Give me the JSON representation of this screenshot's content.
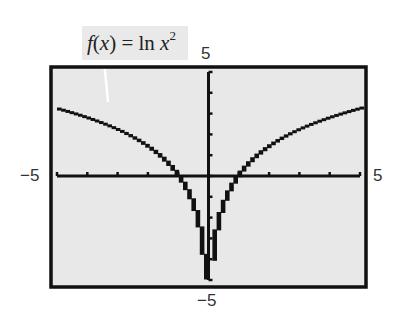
{
  "chart_data": {
    "type": "line",
    "function": "ln(x^2)",
    "xlabel": "",
    "ylabel": "",
    "xlim": [
      -5,
      5
    ],
    "ylim": [
      -5,
      5
    ],
    "xscale": 1,
    "yscale": 1,
    "grid": false,
    "window_labels": {
      "xmin": "−5",
      "xmax": "5",
      "ymin": "−5",
      "ymax": "5"
    },
    "series": [
      {
        "name": "f(x) = ln x^2",
        "x": [
          -5,
          -4,
          -3,
          -2,
          -1.5,
          -1,
          -0.5,
          -0.25,
          -0.1,
          0.1,
          0.25,
          0.5,
          1,
          1.5,
          2,
          3,
          4,
          5
        ],
        "y": [
          3.22,
          2.77,
          2.2,
          1.39,
          0.81,
          0,
          -1.39,
          -2.77,
          -4.61,
          -4.61,
          -2.77,
          -1.39,
          0,
          0.81,
          1.39,
          2.2,
          2.77,
          3.22
        ]
      }
    ],
    "annotations": [
      "f(x) = ln x²"
    ]
  },
  "label": {
    "prefix": "f",
    "open": "(",
    "var": "x",
    "close": ")",
    "eq": " = ln ",
    "base": "x",
    "exp": "2"
  },
  "axes": {
    "xmin_label": "−5",
    "xmax_label": "5",
    "ymin_label": "−5",
    "ymax_label": "5"
  },
  "colors": {
    "screen_bg": "#e8e8e8",
    "frame": "#111111",
    "curve": "#111111",
    "label_bg": "#e9e9e9"
  }
}
